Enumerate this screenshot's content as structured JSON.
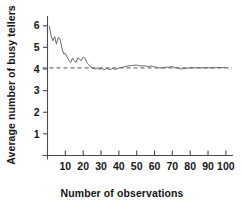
{
  "chart_data": {
    "type": "line",
    "title": "",
    "subtitle": "",
    "xlabel": "Number of observations",
    "ylabel": "Average number of busy tellers",
    "xlim": [
      0,
      104
    ],
    "ylim": [
      0,
      6.45
    ],
    "grid": false,
    "legend": null,
    "xticks": [
      10,
      20,
      30,
      40,
      50,
      60,
      70,
      80,
      90,
      100
    ],
    "xtick_labels": [
      "10",
      "20",
      "30",
      "40",
      "50",
      "60",
      "70",
      "80",
      "90",
      "100"
    ],
    "yticks": [
      1,
      2,
      3,
      4,
      5,
      6
    ],
    "ytick_labels": [
      "1",
      "2",
      "3",
      "4",
      "5",
      "6"
    ],
    "annotations": [
      {
        "name": "steady-state-reference-line",
        "type": "hline",
        "y": 4.05,
        "style": "dashed",
        "color": "#555555"
      }
    ],
    "series": [
      {
        "name": "Running average of busy tellers",
        "color": "#666666",
        "x": [
          1,
          2,
          3,
          4,
          5,
          6,
          7,
          8,
          9,
          10,
          11,
          12,
          13,
          14,
          15,
          16,
          17,
          18,
          19,
          20,
          21,
          22,
          23,
          24,
          25,
          26,
          27,
          28,
          29,
          30,
          31,
          32,
          33,
          34,
          35,
          36,
          37,
          38,
          39,
          40,
          41,
          42,
          43,
          44,
          45,
          46,
          47,
          48,
          49,
          50,
          51,
          52,
          53,
          54,
          55,
          56,
          57,
          58,
          59,
          60,
          61,
          62,
          63,
          64,
          65,
          66,
          67,
          68,
          69,
          70,
          71,
          72,
          73,
          74,
          75,
          76,
          77,
          78,
          79,
          80,
          81,
          82,
          83,
          84,
          85,
          86,
          87,
          88,
          89,
          90,
          91,
          92,
          93,
          94,
          95,
          96,
          97,
          98,
          99,
          100
        ],
        "values": [
          6.0,
          5.55,
          5.3,
          5.5,
          5.15,
          5.45,
          5.4,
          5.0,
          4.7,
          4.72,
          4.55,
          4.4,
          4.3,
          4.5,
          4.38,
          4.3,
          4.52,
          4.45,
          4.38,
          4.55,
          4.5,
          4.3,
          4.22,
          4.12,
          4.05,
          4.02,
          4.0,
          4.05,
          3.98,
          4.02,
          4.0,
          3.98,
          4.02,
          4.0,
          3.98,
          4.0,
          4.02,
          3.98,
          4.0,
          4.05,
          4.06,
          4.08,
          4.1,
          4.12,
          4.14,
          4.15,
          4.16,
          4.16,
          4.18,
          4.18,
          4.16,
          4.15,
          4.14,
          4.15,
          4.14,
          4.12,
          4.12,
          4.14,
          4.12,
          4.1,
          4.08,
          4.06,
          4.05,
          4.04,
          4.06,
          4.08,
          4.08,
          4.08,
          4.1,
          4.1,
          4.08,
          4.06,
          4.05,
          4.02,
          4.0,
          4.02,
          4.02,
          4.04,
          4.04,
          4.05,
          4.06,
          4.05,
          4.06,
          4.05,
          4.06,
          4.05,
          4.06,
          4.06,
          4.05,
          4.06,
          4.06,
          4.05,
          4.06,
          4.06,
          4.07,
          4.06,
          4.07,
          4.06,
          4.07,
          4.07
        ]
      }
    ]
  },
  "axes": {
    "yaxis_name": "y-axis",
    "xaxis_name": "x-axis"
  }
}
